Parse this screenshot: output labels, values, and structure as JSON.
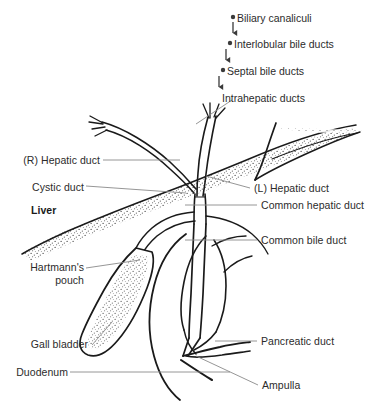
{
  "figure": {
    "background_color": "#ffffff",
    "ink_color": "#1a1a1a",
    "label_color": "#2b2b2b",
    "leader_color": "#8a8a8a"
  },
  "cascade": {
    "items": [
      {
        "label": "Biliary canaliculi",
        "bullet": "bullet-dot",
        "arrow": "down-arrow"
      },
      {
        "label": "Interlobular bile ducts",
        "bullet": "bullet-dot",
        "arrow": "down-arrow"
      },
      {
        "label": "Septal bile ducts",
        "bullet": "bullet-dot",
        "arrow": "down-arrow"
      },
      {
        "label": "Intrahepatic ducts",
        "bullet": "none",
        "arrow": "none"
      }
    ]
  },
  "labels": {
    "right_hepatic_duct": "(R) Hepatic duct",
    "cystic_duct": "Cystic duct",
    "liver": "Liver",
    "hartmanns_pouch_line1": "Hartmann's",
    "hartmanns_pouch_line2": "pouch",
    "gall_bladder": "Gall bladder",
    "duodenum": "Duodenum",
    "left_hepatic_duct": "(L) Hepatic duct",
    "common_hepatic_duct": "Common hepatic duct",
    "common_bile_duct": "Common bile duct",
    "pancreatic_duct": "Pancreatic duct",
    "ampulla": "Ampulla"
  },
  "structures": [
    {
      "name": "liver-wedge",
      "description": "stippled wedge spanning upper-left to right lobe tip"
    },
    {
      "name": "right-hepatic-duct",
      "description": "branching duct from upper left"
    },
    {
      "name": "left-hepatic-duct",
      "description": "branching duct descending from top center"
    },
    {
      "name": "common-hepatic-duct",
      "description": "duct below hepatic confluence"
    },
    {
      "name": "cystic-duct",
      "description": "duct linking gall bladder to common duct"
    },
    {
      "name": "gall-bladder",
      "description": "pear shaped stippled sac lower left"
    },
    {
      "name": "common-bile-duct",
      "description": "long duct descending to ampulla"
    },
    {
      "name": "duodenum",
      "description": "C-loop of small bowel"
    },
    {
      "name": "pancreatic-duct",
      "description": "duct joining bile duct at ampulla"
    },
    {
      "name": "ampulla",
      "description": "confluence of bile and pancreatic ducts"
    }
  ]
}
